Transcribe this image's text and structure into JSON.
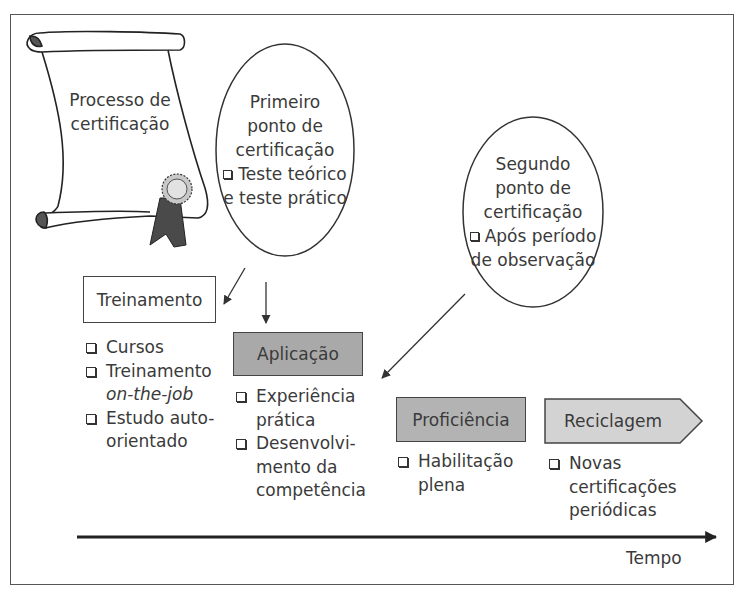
{
  "scroll": {
    "label_lines": [
      "Processo de",
      "certificação"
    ]
  },
  "first_checkpoint": {
    "title_lines": [
      "Primeiro",
      "ponto de",
      "certificação"
    ],
    "bullet_lines": [
      "Teste teórico",
      "e teste prático"
    ]
  },
  "second_checkpoint": {
    "title_lines": [
      "Segundo",
      "ponto de",
      "certificação"
    ],
    "bullet_lines": [
      "Após período",
      "de observação"
    ]
  },
  "stages": [
    {
      "id": "treinamento",
      "label": "Treinamento",
      "fill": "#ffffff",
      "items": [
        {
          "lines": [
            "Cursos"
          ]
        },
        {
          "lines": [
            "Treinamento"
          ],
          "italic_line": "on-the-job"
        },
        {
          "lines": [
            "Estudo auto-",
            "orientado"
          ]
        }
      ]
    },
    {
      "id": "aplicacao",
      "label": "Aplicação",
      "fill": "#a9a9a9",
      "items": [
        {
          "lines": [
            "Experiência",
            "prática"
          ]
        },
        {
          "lines": [
            "Desenvolvi-",
            "mento da",
            "competência"
          ]
        }
      ]
    },
    {
      "id": "proficiencia",
      "label": "Proficiência",
      "fill": "#b3b3b3",
      "items": [
        {
          "lines": [
            "Habilitação",
            "plena"
          ]
        }
      ]
    },
    {
      "id": "reciclagem",
      "label": "Reciclagem",
      "fill": "#d3d3d3",
      "items": [
        {
          "lines": [
            "Novas",
            "certificações",
            "periódicas"
          ]
        }
      ]
    }
  ],
  "timeline": {
    "label": "Tempo"
  },
  "colors": {
    "stroke": "#333333",
    "text": "#3a3a3a",
    "seal_dark": "#4a4a4a",
    "seal_light": "#d8d8d8"
  }
}
